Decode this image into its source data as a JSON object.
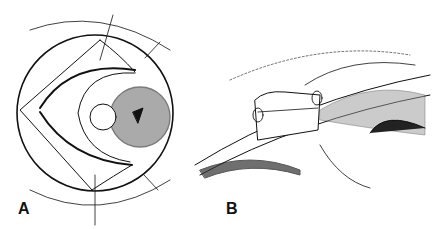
{
  "figure": {
    "panels": [
      {
        "id": "A",
        "label": "A",
        "description": "Frontal view of eye with triangular scleral flap sutures"
      },
      {
        "id": "B",
        "label": "B",
        "description": "Cross-section view with sutured scleral block"
      }
    ]
  },
  "colors": {
    "ink": "#111111",
    "background": "#ffffff"
  }
}
